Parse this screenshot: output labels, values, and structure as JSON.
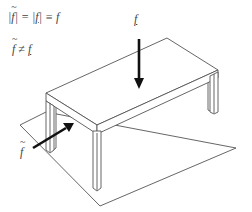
{
  "equations": {
    "line1": {
      "bar_left": "|",
      "f_tilde": "f",
      "bar_mid": "| = |",
      "f_under": "f",
      "bar_right": "| ≡ ",
      "f_plain": "f"
    },
    "line2": {
      "f_tilde": "f",
      "neq": " ≠ ",
      "f_under": "f"
    }
  },
  "labels": {
    "vertical_force": "f",
    "diagonal_force": "f"
  },
  "diagram": {
    "line_color": "#555555",
    "arrow_color": "#111111"
  }
}
